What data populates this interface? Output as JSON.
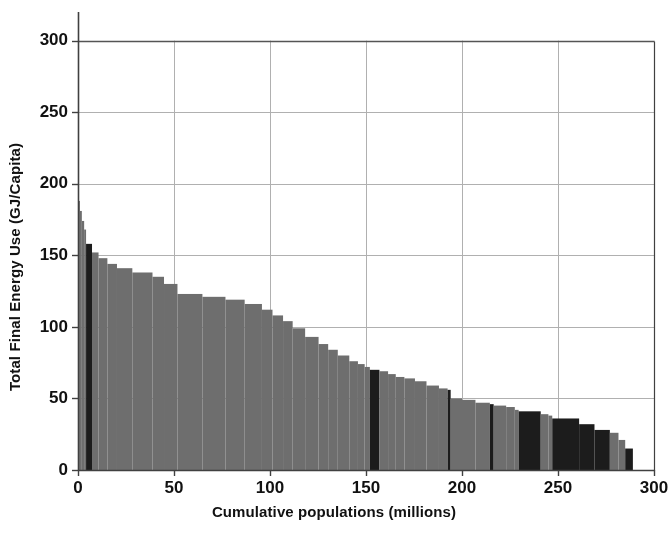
{
  "chart_data": {
    "type": "bar",
    "title": "",
    "subtitle": "",
    "xlabel": "Cumulative populations (millions)",
    "ylabel": "Total Final Energy Use (GJ/Capita)",
    "xlim": [
      0,
      300
    ],
    "ylim": [
      0,
      320
    ],
    "xticks": [
      0,
      50,
      100,
      150,
      200,
      250,
      300
    ],
    "xtick_labels": [
      "0",
      "50",
      "100",
      "150",
      "200",
      "250",
      "300"
    ],
    "yticks": [
      0,
      50,
      100,
      150,
      200,
      250,
      300
    ],
    "ytick_labels": [
      "0",
      "50",
      "100",
      "150",
      "200",
      "250",
      "300"
    ],
    "grid": "both",
    "legend": "none",
    "orientation": "vertical-variable-width",
    "colors": {
      "bar_light": "#6e6e6e",
      "bar_dark": "#1c1c1c",
      "axis": "#404040",
      "grid": "#b0b0b0",
      "frame_top": "#555555",
      "background": "#ffffff",
      "text": "#111111"
    },
    "bars": [
      {
        "x0": 0.0,
        "width": 1.0,
        "value": 188,
        "shade": "light"
      },
      {
        "x0": 1.0,
        "width": 1.0,
        "value": 181,
        "shade": "light"
      },
      {
        "x0": 2.0,
        "width": 1.2,
        "value": 174,
        "shade": "light"
      },
      {
        "x0": 3.2,
        "width": 1.0,
        "value": 168,
        "shade": "light"
      },
      {
        "x0": 4.2,
        "width": 3.1,
        "value": 158,
        "shade": "dark"
      },
      {
        "x0": 7.3,
        "width": 3.4,
        "value": 152,
        "shade": "light"
      },
      {
        "x0": 10.7,
        "width": 4.6,
        "value": 148,
        "shade": "light"
      },
      {
        "x0": 15.3,
        "width": 5.0,
        "value": 144,
        "shade": "light"
      },
      {
        "x0": 20.3,
        "width": 8.0,
        "value": 141,
        "shade": "light"
      },
      {
        "x0": 28.3,
        "width": 10.5,
        "value": 138,
        "shade": "light"
      },
      {
        "x0": 38.8,
        "width": 6.0,
        "value": 135,
        "shade": "light"
      },
      {
        "x0": 44.8,
        "width": 7.0,
        "value": 130,
        "shade": "light"
      },
      {
        "x0": 51.8,
        "width": 13.0,
        "value": 123,
        "shade": "light"
      },
      {
        "x0": 64.8,
        "width": 12.0,
        "value": 121,
        "shade": "light"
      },
      {
        "x0": 76.8,
        "width": 10.0,
        "value": 119,
        "shade": "light"
      },
      {
        "x0": 86.8,
        "width": 9.0,
        "value": 116,
        "shade": "light"
      },
      {
        "x0": 95.8,
        "width": 5.5,
        "value": 112,
        "shade": "light"
      },
      {
        "x0": 101.3,
        "width": 5.5,
        "value": 108,
        "shade": "light"
      },
      {
        "x0": 106.8,
        "width": 5.0,
        "value": 104,
        "shade": "light"
      },
      {
        "x0": 111.8,
        "width": 6.5,
        "value": 99,
        "shade": "light"
      },
      {
        "x0": 118.3,
        "width": 7.0,
        "value": 93,
        "shade": "light"
      },
      {
        "x0": 125.3,
        "width": 5.0,
        "value": 88,
        "shade": "light"
      },
      {
        "x0": 130.3,
        "width": 5.0,
        "value": 84,
        "shade": "light"
      },
      {
        "x0": 135.3,
        "width": 6.0,
        "value": 80,
        "shade": "light"
      },
      {
        "x0": 141.3,
        "width": 4.5,
        "value": 76,
        "shade": "light"
      },
      {
        "x0": 145.8,
        "width": 3.5,
        "value": 74,
        "shade": "light"
      },
      {
        "x0": 149.3,
        "width": 2.7,
        "value": 72,
        "shade": "light"
      },
      {
        "x0": 152.0,
        "width": 5.0,
        "value": 70,
        "shade": "dark"
      },
      {
        "x0": 157.0,
        "width": 4.5,
        "value": 69,
        "shade": "light"
      },
      {
        "x0": 161.5,
        "width": 4.0,
        "value": 67,
        "shade": "light"
      },
      {
        "x0": 165.5,
        "width": 4.5,
        "value": 65,
        "shade": "light"
      },
      {
        "x0": 170.0,
        "width": 5.5,
        "value": 64,
        "shade": "light"
      },
      {
        "x0": 175.5,
        "width": 6.0,
        "value": 62,
        "shade": "light"
      },
      {
        "x0": 181.5,
        "width": 6.5,
        "value": 59,
        "shade": "light"
      },
      {
        "x0": 188.0,
        "width": 4.5,
        "value": 57,
        "shade": "light"
      },
      {
        "x0": 192.5,
        "width": 1.6,
        "value": 56,
        "shade": "dark"
      },
      {
        "x0": 194.1,
        "width": 5.9,
        "value": 50,
        "shade": "light"
      },
      {
        "x0": 200.0,
        "width": 7.0,
        "value": 49,
        "shade": "light"
      },
      {
        "x0": 207.0,
        "width": 7.5,
        "value": 47,
        "shade": "light"
      },
      {
        "x0": 214.5,
        "width": 2.0,
        "value": 46,
        "shade": "dark"
      },
      {
        "x0": 216.5,
        "width": 6.5,
        "value": 45,
        "shade": "light"
      },
      {
        "x0": 223.0,
        "width": 4.5,
        "value": 44,
        "shade": "light"
      },
      {
        "x0": 227.5,
        "width": 2.0,
        "value": 42,
        "shade": "light"
      },
      {
        "x0": 229.5,
        "width": 11.5,
        "value": 41,
        "shade": "dark"
      },
      {
        "x0": 241.0,
        "width": 4.0,
        "value": 39,
        "shade": "light"
      },
      {
        "x0": 245.0,
        "width": 2.0,
        "value": 38,
        "shade": "light"
      },
      {
        "x0": 247.0,
        "width": 14.0,
        "value": 36,
        "shade": "dark"
      },
      {
        "x0": 261.0,
        "width": 8.0,
        "value": 32,
        "shade": "dark"
      },
      {
        "x0": 269.0,
        "width": 8.0,
        "value": 28,
        "shade": "dark"
      },
      {
        "x0": 277.0,
        "width": 4.5,
        "value": 26,
        "shade": "light"
      },
      {
        "x0": 281.5,
        "width": 3.5,
        "value": 21,
        "shade": "light"
      },
      {
        "x0": 285.0,
        "width": 4.0,
        "value": 15,
        "shade": "dark"
      }
    ]
  }
}
